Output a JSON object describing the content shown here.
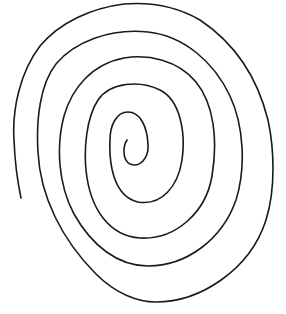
{
  "image": {
    "description": "Hand-drawn spiral line on a white background",
    "background_color": "#ffffff",
    "stroke_color": "#1a1a1a",
    "stroke_width": 1.6,
    "spiral_turns": 5,
    "center_start": [
      127,
      140
    ],
    "outer_end": [
      21,
      198
    ]
  }
}
